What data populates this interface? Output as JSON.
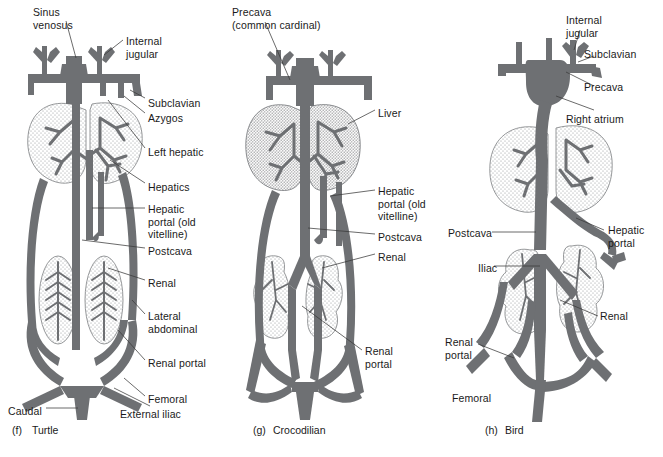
{
  "figure": {
    "colors": {
      "vessel": "#6e7073",
      "organ_fill": "#fdfdfd",
      "organ_stroke": "#8a8c8f",
      "text": "#1a1a1a",
      "leader": "#3a3a3a",
      "background": "#ffffff"
    }
  },
  "panels": [
    {
      "id": "turtle",
      "tag": "(f)",
      "name": "Turtle",
      "caption": {
        "x": 12,
        "y": 424
      },
      "labels": [
        {
          "name": "sinus-venosus",
          "text": "Sinus\nvenosus",
          "x": 33,
          "y": 6
        },
        {
          "name": "internal-jugular",
          "text": "Internal\njugular",
          "x": 126,
          "y": 35
        },
        {
          "name": "subclavian",
          "text": "Subclavian",
          "x": 148,
          "y": 97
        },
        {
          "name": "azygos",
          "text": "Azygos",
          "x": 148,
          "y": 112
        },
        {
          "name": "left-hepatic",
          "text": "Left hepatic",
          "x": 148,
          "y": 146
        },
        {
          "name": "hepatics",
          "text": "Hepatics",
          "x": 148,
          "y": 181
        },
        {
          "name": "hepatic-portal",
          "text": "Hepatic\nportal (old\nvitelline)",
          "x": 148,
          "y": 203
        },
        {
          "name": "postcava",
          "text": "Postcava",
          "x": 148,
          "y": 245
        },
        {
          "name": "renal",
          "text": "Renal",
          "x": 148,
          "y": 277
        },
        {
          "name": "lateral-abdominal",
          "text": "Lateral\nabdominal",
          "x": 148,
          "y": 310
        },
        {
          "name": "renal-portal",
          "text": "Renal portal",
          "x": 148,
          "y": 357
        },
        {
          "name": "femoral",
          "text": "Femoral",
          "x": 148,
          "y": 393
        },
        {
          "name": "external-iliac",
          "text": "External iliac",
          "x": 120,
          "y": 408
        },
        {
          "name": "caudal",
          "text": "Caudal",
          "x": 8,
          "y": 405
        }
      ]
    },
    {
      "id": "crocodilian",
      "tag": "(g)",
      "name": "Crocodilian",
      "caption": {
        "x": 253,
        "y": 424
      },
      "labels": [
        {
          "name": "precava",
          "text": "Precava\n(common cardinal)",
          "x": 232,
          "y": 6
        },
        {
          "name": "liver",
          "text": "Liver",
          "x": 378,
          "y": 107
        },
        {
          "name": "hepatic-portal",
          "text": "Hepatic\nportal (old\nvitelline)",
          "x": 378,
          "y": 185
        },
        {
          "name": "postcava",
          "text": "Postcava",
          "x": 378,
          "y": 231
        },
        {
          "name": "renal",
          "text": "Renal",
          "x": 378,
          "y": 251
        },
        {
          "name": "renal-portal",
          "text": "Renal\nportal",
          "x": 365,
          "y": 345
        }
      ]
    },
    {
      "id": "bird",
      "tag": "(h)",
      "name": "Bird",
      "caption": {
        "x": 485,
        "y": 424
      },
      "labels": [
        {
          "name": "internal-jugular",
          "text": "Internal\njugular",
          "x": 566,
          "y": 14
        },
        {
          "name": "subclavian",
          "text": "Subclavian",
          "x": 584,
          "y": 48
        },
        {
          "name": "precava",
          "text": "Precava",
          "x": 584,
          "y": 81
        },
        {
          "name": "right-atrium",
          "text": "Right atrium",
          "x": 566,
          "y": 113
        },
        {
          "name": "hepatic-portal",
          "text": "Hepatic\nportal",
          "x": 608,
          "y": 224
        },
        {
          "name": "postcava",
          "text": "Postcava",
          "x": 448,
          "y": 227
        },
        {
          "name": "iliac",
          "text": "Iliac",
          "x": 478,
          "y": 262
        },
        {
          "name": "renal",
          "text": "Renal",
          "x": 600,
          "y": 310
        },
        {
          "name": "renal-portal",
          "text": "Renal\nportal",
          "x": 445,
          "y": 336
        },
        {
          "name": "femoral",
          "text": "Femoral",
          "x": 452,
          "y": 392
        }
      ]
    }
  ]
}
